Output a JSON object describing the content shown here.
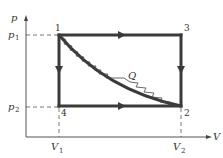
{
  "diagram": {
    "title": "",
    "type": "p-V diagram thermodynamic cycle",
    "axes": {
      "y_label": "p",
      "x_label": "V",
      "y_ticks": [
        {
          "base": "p",
          "sub": "1"
        },
        {
          "base": "p",
          "sub": "2"
        }
      ],
      "x_ticks": [
        {
          "base": "V",
          "sub": "1"
        },
        {
          "base": "V",
          "sub": "2"
        }
      ]
    },
    "points": [
      {
        "label": "1",
        "p": "p1",
        "V": "V1"
      },
      {
        "label": "2",
        "p": "p2",
        "V": "V2"
      },
      {
        "label": "3",
        "p": "p1",
        "V": "V2"
      },
      {
        "label": "4",
        "p": "p2",
        "V": "V1"
      }
    ],
    "paths": [
      {
        "from": "1",
        "to": "3",
        "style": "thick line, arrow right"
      },
      {
        "from": "3",
        "to": "2",
        "style": "thick line, arrow down"
      },
      {
        "from": "1",
        "to": "4",
        "style": "thick line, arrow down"
      },
      {
        "from": "4",
        "to": "2",
        "style": "thick line, arrow right"
      },
      {
        "from": "1",
        "to": "2",
        "style": "thick curve"
      },
      {
        "from": "1",
        "to": "2",
        "style": "zigzag wavy line"
      }
    ],
    "annotation": "Q",
    "colors": {
      "line": "#3a3a3a",
      "axis": "#555555",
      "background": "#ffffff"
    }
  }
}
